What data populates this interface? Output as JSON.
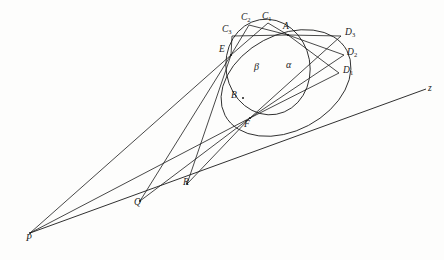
{
  "figure": {
    "background_color": "#fdfdfc",
    "stroke_color": "#1a1a1a"
  },
  "points": {
    "A": {
      "label": "A",
      "sub": "",
      "x": 288,
      "y": 35,
      "label_x": 283,
      "label_y": 22
    },
    "B": {
      "label": "B",
      "sub": "",
      "x": 243,
      "y": 98,
      "label_x": 231,
      "label_y": 91
    },
    "E": {
      "label": "E",
      "sub": "",
      "x": 231,
      "y": 55,
      "label_x": 219,
      "label_y": 45
    },
    "F": {
      "label": "F",
      "sub": "",
      "x": 250,
      "y": 118,
      "label_x": 244,
      "label_y": 120
    },
    "P": {
      "label": "P",
      "sub": "",
      "x": 30,
      "y": 233,
      "label_x": 26,
      "label_y": 234
    },
    "Q": {
      "label": "Q",
      "sub": "",
      "x": 140,
      "y": 201,
      "label_x": 134,
      "label_y": 198
    },
    "R": {
      "label": "R",
      "sub": "",
      "x": 187,
      "y": 184,
      "label_x": 183,
      "label_y": 178
    },
    "C1": {
      "label": "C",
      "sub": "1",
      "x": 268,
      "y": 23,
      "label_x": 262,
      "label_y": 12
    },
    "C2": {
      "label": "C",
      "sub": "2",
      "x": 249,
      "y": 25,
      "label_x": 241,
      "label_y": 13
    },
    "C3": {
      "label": "C",
      "sub": "3",
      "x": 232,
      "y": 36,
      "label_x": 222,
      "label_y": 25
    },
    "D1": {
      "label": "D",
      "sub": "1",
      "x": 339,
      "y": 73,
      "label_x": 343,
      "label_y": 66
    },
    "D2": {
      "label": "D",
      "sub": "2",
      "x": 344,
      "y": 55,
      "label_x": 347,
      "label_y": 48
    },
    "D3": {
      "label": "D",
      "sub": "3",
      "x": 341,
      "y": 36,
      "label_x": 345,
      "label_y": 28
    },
    "z": {
      "label": "z",
      "sub": "",
      "x": 426,
      "y": 89,
      "label_x": 428,
      "label_y": 84
    }
  },
  "conics": {
    "alpha": {
      "name": "alpha",
      "label": "α",
      "label_x": 286,
      "label_y": 60,
      "cx": 286,
      "cy": 83,
      "rx": 69,
      "ry": 48,
      "rotation": -28
    },
    "beta": {
      "name": "beta",
      "label": "β",
      "label_x": 254,
      "label_y": 62,
      "cx": 268,
      "cy": 67,
      "rx": 42,
      "ry": 48,
      "rotation": -10
    }
  },
  "chords": [
    {
      "name": "A-C1",
      "from": "A",
      "to": "C1"
    },
    {
      "name": "A-C2",
      "from": "A",
      "to": "C2"
    },
    {
      "name": "A-C3",
      "from": "A",
      "to": "C3"
    },
    {
      "name": "A-D1",
      "from": "A",
      "to": "D1"
    },
    {
      "name": "A-D2",
      "from": "A",
      "to": "D2"
    },
    {
      "name": "A-D3",
      "from": "A",
      "to": "D3"
    },
    {
      "name": "E-C1",
      "from": "E",
      "to": "C1"
    },
    {
      "name": "E-C2",
      "from": "E",
      "to": "C2"
    },
    {
      "name": "E-C3",
      "from": "E",
      "to": "C3"
    },
    {
      "name": "F-D1",
      "from": "F",
      "to": "D1"
    },
    {
      "name": "F-D2",
      "from": "F",
      "to": "D2"
    },
    {
      "name": "F-D3",
      "from": "F",
      "to": "D3"
    }
  ],
  "rays": [
    {
      "name": "P-to-E",
      "from": "P",
      "to": "E"
    },
    {
      "name": "P-to-F",
      "from": "P",
      "to": "F"
    },
    {
      "name": "Q-to-E",
      "from": "Q",
      "to": "E"
    },
    {
      "name": "Q-to-F",
      "from": "Q",
      "to": "F"
    },
    {
      "name": "R-to-E",
      "from": "R",
      "to": "E"
    },
    {
      "name": "R-to-F",
      "from": "R",
      "to": "F"
    }
  ],
  "axis": {
    "name": "perspective-axis-z",
    "from": "P",
    "through": [
      "Q",
      "R"
    ],
    "to": "z",
    "label": "z"
  }
}
